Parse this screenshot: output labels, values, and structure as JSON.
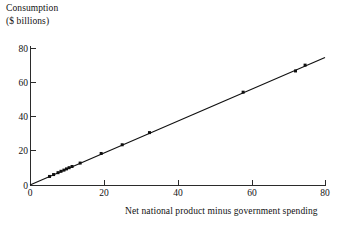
{
  "chart_data": {
    "type": "scatter",
    "title": "",
    "ylabel_lines": [
      "Consumption",
      "($ billions)"
    ],
    "ylabel": "Consumption ($ billions)",
    "xlabel": "Net national product minus government spending",
    "xlim": [
      0,
      80
    ],
    "ylim": [
      0,
      80
    ],
    "xticks": [
      0,
      20,
      40,
      60,
      80
    ],
    "yticks": [
      0,
      20,
      40,
      60,
      80
    ],
    "xtick_labels": [
      "0",
      "20",
      "40",
      "60",
      "80"
    ],
    "ytick_labels": [
      "0",
      "20",
      "40",
      "60",
      "80"
    ],
    "grid": false,
    "legend": false,
    "marker": "filled-square",
    "points": [
      {
        "x": 5.3,
        "y": 5.0
      },
      {
        "x": 6.4,
        "y": 6.1
      },
      {
        "x": 7.6,
        "y": 7.2
      },
      {
        "x": 8.4,
        "y": 8.0
      },
      {
        "x": 9.2,
        "y": 8.7
      },
      {
        "x": 9.9,
        "y": 9.4
      },
      {
        "x": 10.6,
        "y": 10.1
      },
      {
        "x": 11.4,
        "y": 10.8
      },
      {
        "x": 13.6,
        "y": 12.8
      },
      {
        "x": 19.3,
        "y": 18.4
      },
      {
        "x": 25.0,
        "y": 23.5
      },
      {
        "x": 32.4,
        "y": 30.6
      },
      {
        "x": 57.8,
        "y": 54.2
      },
      {
        "x": 72.0,
        "y": 66.6
      },
      {
        "x": 74.6,
        "y": 70.0
      }
    ],
    "fit_line": {
      "x0": 0.0,
      "y0": 0.0,
      "x1": 80.0,
      "y1": 74.5,
      "slope": 0.931,
      "intercept": 0.0
    }
  }
}
